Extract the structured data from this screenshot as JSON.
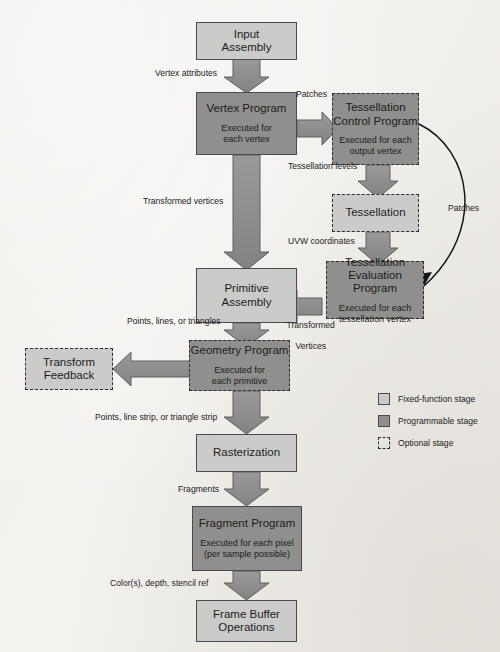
{
  "diagram": {
    "colors": {
      "fixed_function_fill": "#cbcbc9",
      "programmable_fill": "#8f8f8d",
      "border": "#4a4a4a",
      "arrow_fill": "#8a8a88",
      "arrow_stroke": "#5c5c5a",
      "page_background": "#f3f1ee",
      "text": "#1c1c1c"
    },
    "nodes": [
      {
        "id": "input-assembly",
        "title": "Input",
        "title2": "Assembly",
        "subtitle": "",
        "subtitle2": "",
        "stage": "fixed-function",
        "optional": false
      },
      {
        "id": "vertex-program",
        "title": "Vertex Program",
        "title2": "",
        "subtitle": "Executed for",
        "subtitle2": "each vertex",
        "stage": "programmable",
        "optional": false
      },
      {
        "id": "tessellation-control-program",
        "title": "Tessellation",
        "title2": "Control Program",
        "subtitle": "Executed for each",
        "subtitle2": "output vertex",
        "stage": "programmable",
        "optional": true
      },
      {
        "id": "tessellation",
        "title": "Tessellation",
        "title2": "",
        "subtitle": "",
        "subtitle2": "",
        "stage": "fixed-function",
        "optional": true
      },
      {
        "id": "tessellation-evaluation-program",
        "title": "Tessellation",
        "title2": "Evaluation Program",
        "subtitle": "Executed for each",
        "subtitle2": "tessellation vertex",
        "stage": "programmable",
        "optional": true
      },
      {
        "id": "primitive-assembly",
        "title": "Primitive",
        "title2": "Assembly",
        "subtitle": "",
        "subtitle2": "",
        "stage": "fixed-function",
        "optional": false
      },
      {
        "id": "geometry-program",
        "title": "Geometry Program",
        "title2": "",
        "subtitle": "Executed for",
        "subtitle2": "each primitive",
        "stage": "programmable",
        "optional": true
      },
      {
        "id": "transform-feedback",
        "title": "Transform",
        "title2": "Feedback",
        "subtitle": "",
        "subtitle2": "",
        "stage": "fixed-function",
        "optional": true
      },
      {
        "id": "rasterization",
        "title": "Rasterization",
        "title2": "",
        "subtitle": "",
        "subtitle2": "",
        "stage": "fixed-function",
        "optional": false
      },
      {
        "id": "fragment-program",
        "title": "Fragment Program",
        "title2": "",
        "subtitle": "Executed for each pixel",
        "subtitle2": "(per sample possible)",
        "stage": "programmable",
        "optional": false
      },
      {
        "id": "frame-buffer-operations",
        "title": "Frame Buffer",
        "title2": "Operations",
        "subtitle": "",
        "subtitle2": "",
        "stage": "fixed-function",
        "optional": false
      }
    ],
    "edge_labels": [
      {
        "id": "vertex-attributes",
        "text": "Vertex attributes"
      },
      {
        "id": "patches-horizontal",
        "text": "Patches"
      },
      {
        "id": "tessellation-levels",
        "text": "Tessellation levels"
      },
      {
        "id": "uvw-coordinates",
        "text": "UVW coordinates"
      },
      {
        "id": "patches-curved",
        "text": "Patches"
      },
      {
        "id": "transformed-vertices",
        "text": "Transformed vertices"
      },
      {
        "id": "transformed-vertices-2",
        "text": "Transformed",
        "text2": "Vertices"
      },
      {
        "id": "points-lines-triangles",
        "text": "Points, lines, or triangles"
      },
      {
        "id": "points-line-strip-triangle-strip",
        "text": "Points, line strip, or triangle strip"
      },
      {
        "id": "fragments",
        "text": "Fragments"
      },
      {
        "id": "color-depth-stencil",
        "text": "Color(s), depth, stencil ref"
      }
    ],
    "legend": {
      "items": [
        {
          "id": "legend-fixed-function",
          "label": "Fixed-function stage",
          "swatch": "fixed"
        },
        {
          "id": "legend-programmable",
          "label": "Programmable stage",
          "swatch": "programmable"
        },
        {
          "id": "legend-optional",
          "label": "Optional stage",
          "swatch": "optional"
        }
      ]
    }
  }
}
